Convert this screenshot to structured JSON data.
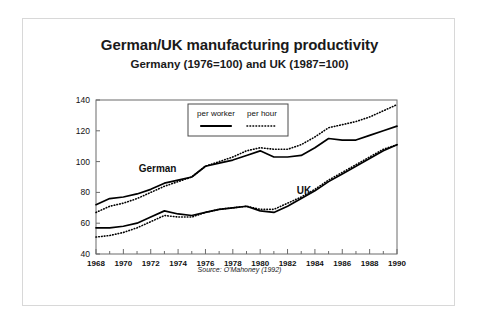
{
  "page": {
    "title": "German/UK manufacturing productivity",
    "subtitle": "Germany (1976=100) and UK (1987=100)",
    "source_note": "Source: O'Mahoney (1992)"
  },
  "chart_data": {
    "type": "line",
    "title": "German/UK manufacturing productivity",
    "subtitle": "Germany (1976=100) and UK (1987=100)",
    "xlabel": "",
    "ylabel": "",
    "xlim": [
      1968,
      1990
    ],
    "ylim": [
      40,
      140
    ],
    "yticks": [
      40,
      60,
      80,
      100,
      120,
      140
    ],
    "xticks": [
      1968,
      1970,
      1972,
      1974,
      1976,
      1978,
      1980,
      1982,
      1984,
      1986,
      1988,
      1990
    ],
    "xtick_labels": [
      "1968",
      "1970",
      "1972",
      "1974",
      "1976",
      "1978",
      "1980",
      "1982",
      "1984",
      "1986",
      "1988",
      "1990"
    ],
    "ytick_labels": [
      "40",
      "60",
      "80",
      "100",
      "120",
      "140"
    ],
    "minor_xticks_every": 1,
    "grid": false,
    "legend": {
      "position": "top-center-inside",
      "entries": [
        {
          "label": "per worker",
          "style": "solid"
        },
        {
          "label": "per hour",
          "style": "dotted"
        }
      ]
    },
    "annotations": [
      {
        "text": "German",
        "x": 1972.5,
        "y": 93
      },
      {
        "text": "UK",
        "x": 1983.2,
        "y": 79
      }
    ],
    "x": [
      1968,
      1969,
      1970,
      1971,
      1972,
      1973,
      1974,
      1975,
      1976,
      1977,
      1978,
      1979,
      1980,
      1981,
      1982,
      1983,
      1984,
      1985,
      1986,
      1987,
      1988,
      1989,
      1990
    ],
    "series": [
      {
        "name": "German per worker",
        "country": "Germany",
        "measure": "per worker",
        "style": "solid",
        "color": "#000000",
        "values": [
          72,
          76,
          77,
          79,
          82,
          86,
          88,
          90,
          97,
          99,
          101,
          104,
          107,
          103,
          103,
          104,
          109,
          115,
          114,
          114,
          117,
          120,
          123
        ]
      },
      {
        "name": "German per hour",
        "country": "Germany",
        "measure": "per hour",
        "style": "dotted",
        "color": "#000000",
        "values": [
          67,
          71,
          73,
          76,
          80,
          84,
          87,
          90,
          97,
          100,
          103,
          107,
          109,
          108,
          108,
          111,
          116,
          122,
          124,
          126,
          129,
          133,
          137
        ]
      },
      {
        "name": "UK per worker",
        "country": "UK",
        "measure": "per worker",
        "style": "solid",
        "color": "#000000",
        "values": [
          57,
          57,
          58,
          60,
          64,
          68,
          66,
          65,
          67,
          69,
          70,
          71,
          68,
          67,
          71,
          76,
          81,
          87,
          92,
          97,
          102,
          107,
          111
        ]
      },
      {
        "name": "UK per hour",
        "country": "UK",
        "measure": "per hour",
        "style": "dotted",
        "color": "#000000",
        "values": [
          51,
          52,
          54,
          57,
          61,
          65,
          64,
          64,
          67,
          69,
          70,
          71,
          69,
          69,
          73,
          77,
          82,
          88,
          93,
          98,
          103,
          108,
          111
        ]
      }
    ]
  }
}
